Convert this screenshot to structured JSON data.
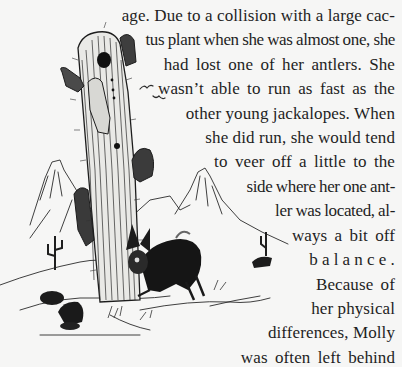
{
  "page": {
    "background": "#f6f6f5",
    "text_color": "#1e1e1e"
  },
  "illustration": {
    "description": "Pen-and-ink drawing of a saguaro cactus with a jackalope crouching at its base, desert mountains behind, birds flying, small rocks and cactus in foreground",
    "elements": [
      "saguaro-cactus",
      "jackalope",
      "mountains",
      "birds",
      "rocks",
      "small-cactus"
    ]
  },
  "body_text": {
    "lines": [
      "age. Due to a collision with a large cac-",
      "tus plant when she was almost one, she",
      "had lost one of her antlers. She",
      "wasn’t able to run as fast as the",
      "other young jackalopes. When",
      "she did run, she would tend",
      "to veer off a little to the",
      "side where her one ant-",
      "ler was located, al-",
      "ways a bit off",
      "balance.",
      "Because of",
      "her physical",
      "differences, Molly",
      "was often left behind"
    ]
  }
}
